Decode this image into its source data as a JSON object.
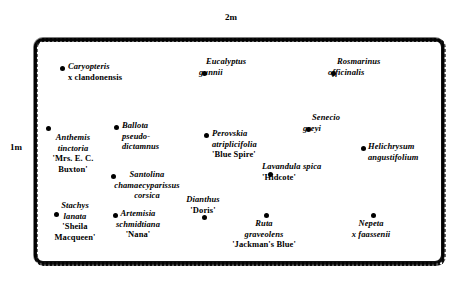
{
  "diagram": {
    "scale_labels": {
      "top": "2m",
      "left": "1m"
    },
    "bed": {
      "shape": "rounded-rectangle",
      "outline_color": "#111111",
      "fill_color": "#ffffff"
    }
  },
  "chart_data": {
    "type": "scatter",
    "xlabel": "2m",
    "ylabel": "1m",
    "grid": false,
    "legend": "none",
    "plants": [
      {
        "id": "caryopteris",
        "lines": [
          "Caryopteris",
          "x clandonensis"
        ],
        "line_styles": [
          "italic",
          "upright"
        ],
        "dot_x": 60,
        "dot_y": 66,
        "label_x": 68,
        "label_y": 61,
        "align": "left"
      },
      {
        "id": "eucalyptus",
        "lines": [
          "Eucalyptus",
          "gunnii"
        ],
        "line_styles": [
          "italic",
          "italic"
        ],
        "dot_x": 202,
        "dot_y": 71,
        "label_x": 199,
        "label_y": 56,
        "align": "left",
        "label_first_line_offset": 7
      },
      {
        "id": "rosmarinus",
        "lines": [
          "Rosmarinus",
          "officinalis"
        ],
        "line_styles": [
          "italic",
          "italic"
        ],
        "dot_x": 331,
        "dot_y": 71,
        "label_x": 328,
        "label_y": 56,
        "align": "left",
        "label_first_line_offset": 9
      },
      {
        "id": "senecio",
        "lines": [
          "Senecio",
          "greyi"
        ],
        "line_styles": [
          "italic",
          "italic"
        ],
        "dot_x": 306,
        "dot_y": 127,
        "label_x": 303,
        "label_y": 112,
        "align": "left",
        "label_first_line_offset": 9
      },
      {
        "id": "ballota",
        "lines": [
          "Ballota",
          "pseudo-",
          "dictamnus"
        ],
        "line_styles": [
          "italic",
          "italic",
          "italic"
        ],
        "dot_x": 114,
        "dot_y": 125,
        "label_x": 122,
        "label_y": 120,
        "align": "left"
      },
      {
        "id": "perovskia",
        "lines": [
          "Perovskia",
          "atriplicifolia",
          "'Blue Spire'"
        ],
        "line_styles": [
          "italic",
          "italic",
          "upright"
        ],
        "dot_x": 204,
        "dot_y": 133,
        "label_x": 212,
        "label_y": 128,
        "align": "left"
      },
      {
        "id": "anthemis",
        "lines": [
          "Anthemis",
          "tinctoria",
          "'Mrs. E. C.",
          "Buxton'"
        ],
        "line_styles": [
          "italic",
          "italic",
          "upright",
          "upright"
        ],
        "dot_x": 46,
        "dot_y": 126,
        "label_x": 40,
        "label_y": 132,
        "align": "center",
        "label_width": 66
      },
      {
        "id": "helichrysum",
        "lines": [
          "Helichrysum",
          "angustifolium"
        ],
        "line_styles": [
          "italic",
          "italic"
        ],
        "dot_x": 361,
        "dot_y": 146,
        "label_x": 368,
        "label_y": 141,
        "align": "left"
      },
      {
        "id": "lavandula",
        "lines": [
          "Lavandula spica",
          "'Hidcote'"
        ],
        "line_styles": [
          "italic",
          "upright"
        ],
        "dot_x": 268,
        "dot_y": 172,
        "label_x": 262,
        "label_y": 161,
        "align": "left",
        "label_first_line_offset": 0
      },
      {
        "id": "santolina",
        "lines": [
          "Santolina",
          "chamaecyparissus",
          "corsica"
        ],
        "line_styles": [
          "italic",
          "italic",
          "italic"
        ],
        "dot_x": 111,
        "dot_y": 174,
        "label_x": 101,
        "label_y": 169,
        "align": "center",
        "label_width": 92
      },
      {
        "id": "dianthus",
        "lines": [
          "Dianthus",
          "'Doris'"
        ],
        "line_styles": [
          "italic",
          "upright"
        ],
        "dot_x": 202,
        "dot_y": 215,
        "label_x": 180,
        "label_y": 194,
        "align": "center",
        "label_width": 46
      },
      {
        "id": "stachys",
        "lines": [
          "Stachys",
          "lanata",
          "'Sheila",
          "Macqueen'"
        ],
        "line_styles": [
          "italic",
          "italic",
          "upright",
          "upright"
        ],
        "dot_x": 54,
        "dot_y": 212,
        "label_x": 46,
        "label_y": 200,
        "align": "center",
        "label_width": 58
      },
      {
        "id": "artemisia",
        "lines": [
          "Artemisia",
          "schmidtiana",
          "'Nana'"
        ],
        "line_styles": [
          "italic",
          "italic",
          "upright"
        ],
        "dot_x": 113,
        "dot_y": 213,
        "label_x": 105,
        "label_y": 208,
        "align": "center",
        "label_width": 66
      },
      {
        "id": "ruta",
        "lines": [
          "Ruta",
          "graveolens",
          "'Jackman's Blue'"
        ],
        "line_styles": [
          "italic",
          "italic",
          "upright"
        ],
        "dot_x": 264,
        "dot_y": 213,
        "label_x": 226,
        "label_y": 218,
        "align": "center",
        "label_width": 76
      },
      {
        "id": "nepeta",
        "lines": [
          "Nepeta",
          "x faassenii"
        ],
        "line_styles": [
          "italic",
          "italic"
        ],
        "dot_x": 371,
        "dot_y": 213,
        "label_x": 340,
        "label_y": 218,
        "align": "center",
        "label_width": 62
      }
    ]
  }
}
